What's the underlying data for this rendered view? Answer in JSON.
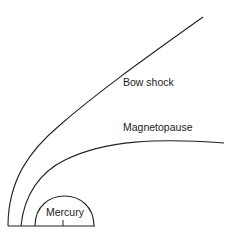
{
  "diagram": {
    "labels": {
      "bow_shock": "Bow shock",
      "magnetopause": "Magnetopause",
      "planet": "Mercury"
    },
    "colors": {
      "line": "#222222",
      "background": "#ffffff"
    }
  }
}
